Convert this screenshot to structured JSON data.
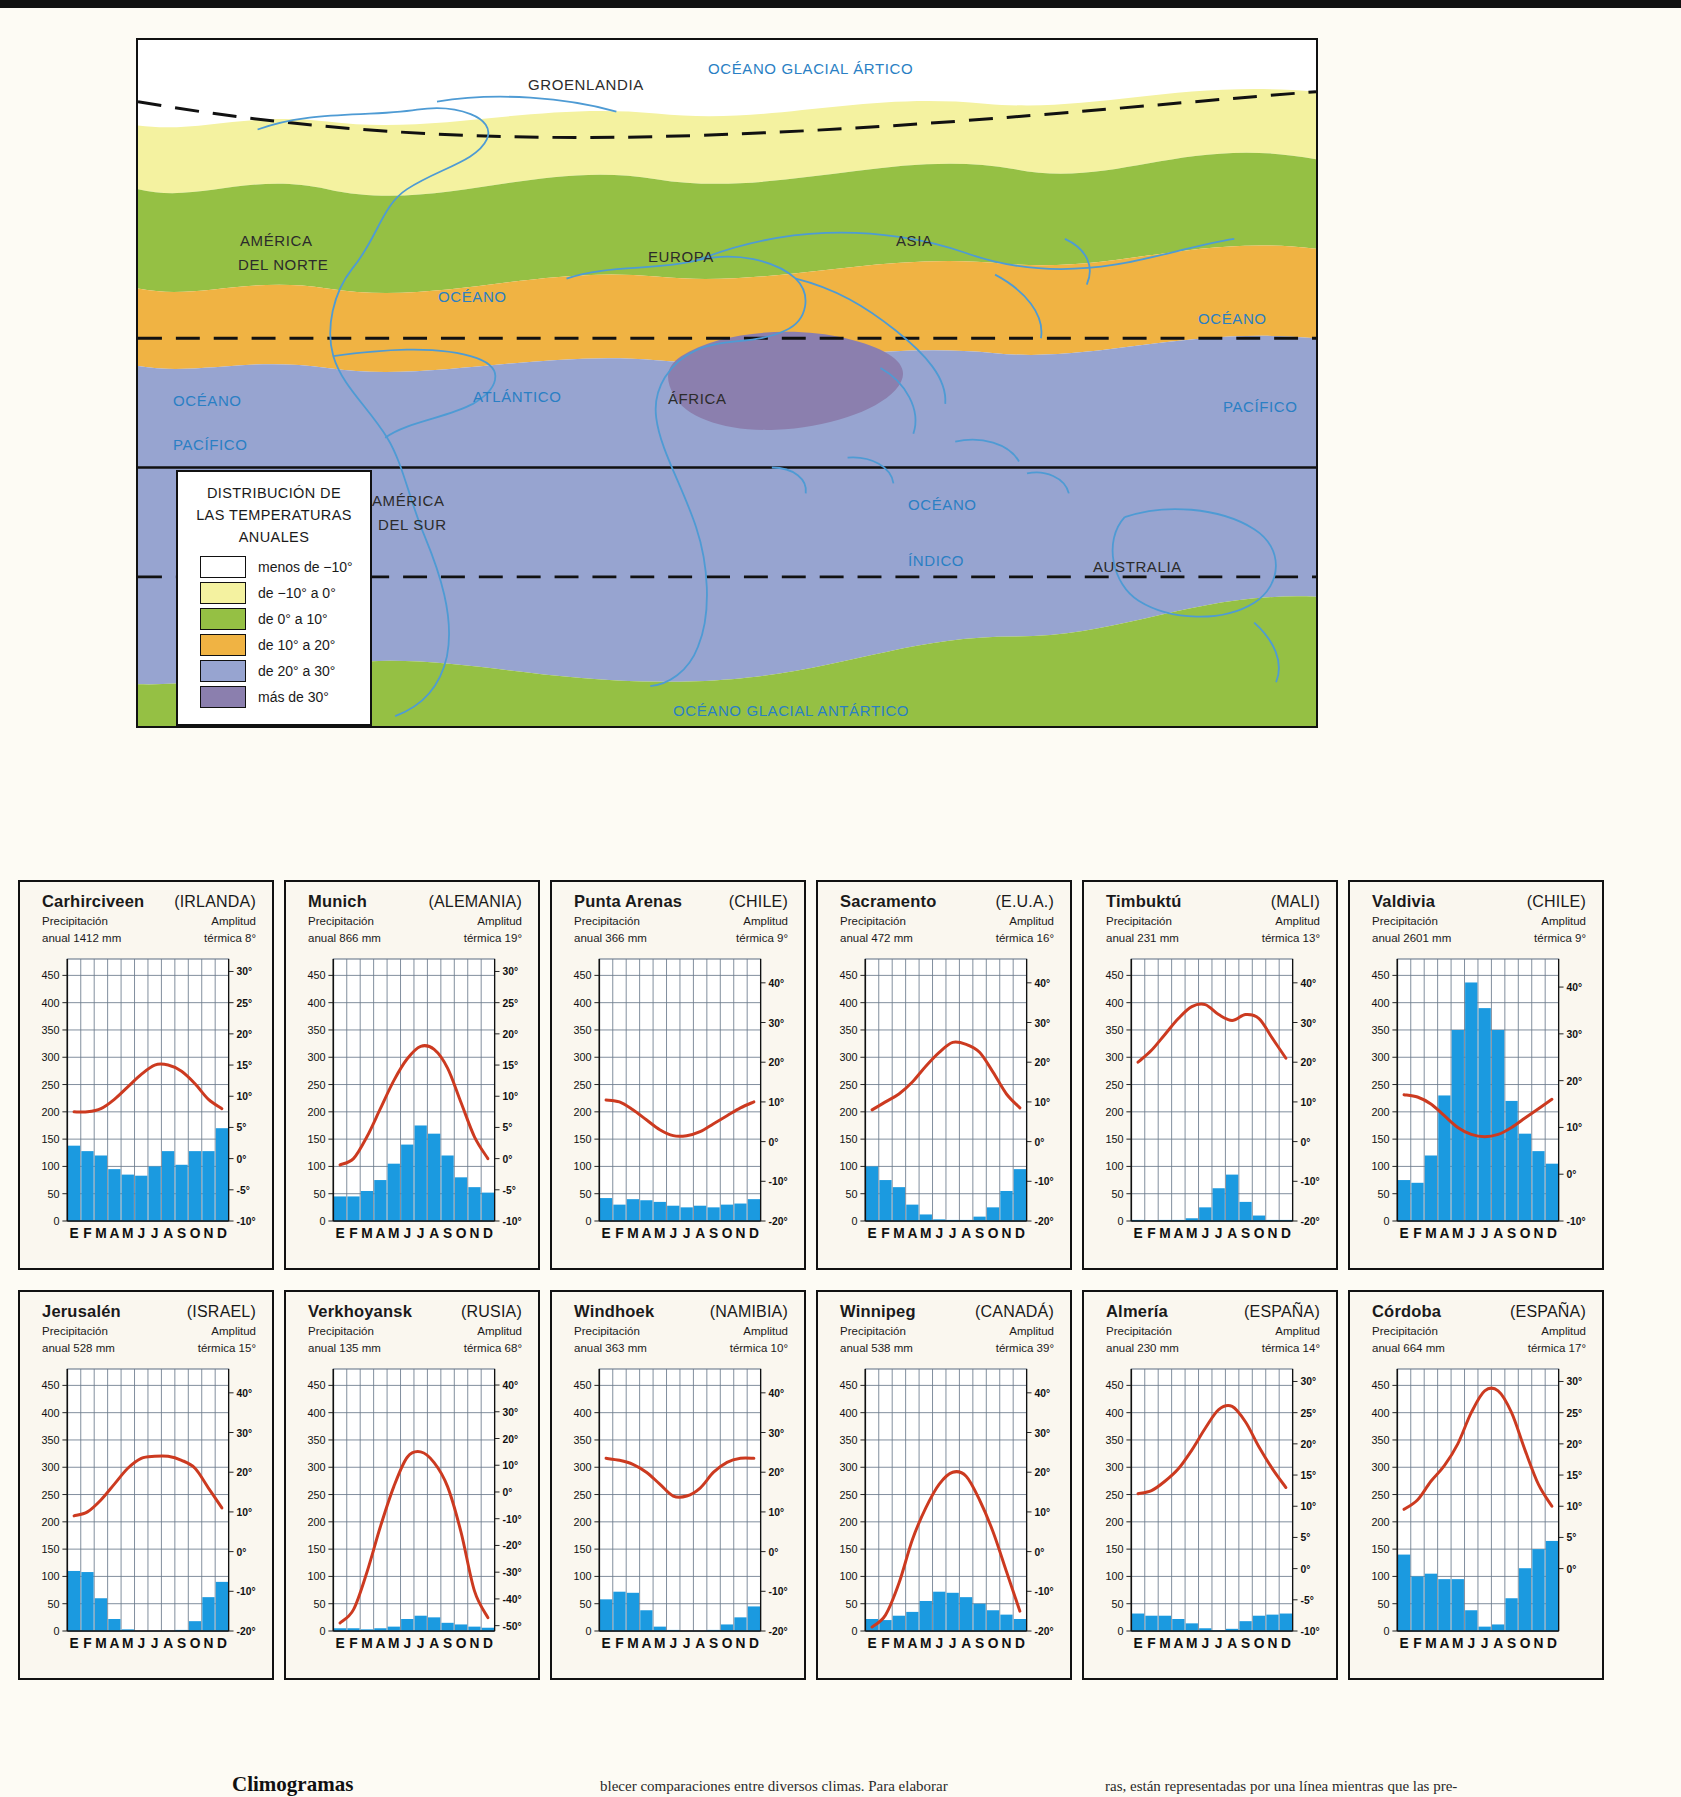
{
  "map": {
    "title_lines": [
      "DISTRIBUCIÓN  DE",
      "LAS TEMPERATURAS",
      "ANUALES"
    ],
    "legend": [
      {
        "label": "menos de −10°",
        "color": "#ffffff"
      },
      {
        "label": "de −10° a 0°",
        "color": "#f4f2a0"
      },
      {
        "label": "de 0° a 10°",
        "color": "#95c044"
      },
      {
        "label": "de 10° a 20°",
        "color": "#f0b343"
      },
      {
        "label": "de 20° a 30°",
        "color": "#97a4d0"
      },
      {
        "label": "más de 30°",
        "color": "#8b7fae"
      }
    ],
    "labels": [
      {
        "text": "OCÉANO GLACIAL ÁRTICO",
        "x": 570,
        "y": 20,
        "ocean": true
      },
      {
        "text": "GROENLANDIA",
        "x": 390,
        "y": 36,
        "ocean": false
      },
      {
        "text": "AMÉRICA",
        "x": 102,
        "y": 192,
        "ocean": false
      },
      {
        "text": "DEL NORTE",
        "x": 100,
        "y": 216,
        "ocean": false
      },
      {
        "text": "EUROPA",
        "x": 510,
        "y": 208,
        "ocean": false
      },
      {
        "text": "ASIA",
        "x": 758,
        "y": 192,
        "ocean": false
      },
      {
        "text": "OCÉANO",
        "x": 300,
        "y": 248,
        "ocean": true
      },
      {
        "text": "OCÉANO",
        "x": 1060,
        "y": 270,
        "ocean": true
      },
      {
        "text": "ATLÁNTICO",
        "x": 335,
        "y": 348,
        "ocean": true
      },
      {
        "text": "ÁFRICA",
        "x": 530,
        "y": 350,
        "ocean": false
      },
      {
        "text": "PACÍFICO",
        "x": 1085,
        "y": 358,
        "ocean": true
      },
      {
        "text": "OCÉANO",
        "x": 35,
        "y": 352,
        "ocean": true
      },
      {
        "text": "PACÍFICO",
        "x": 35,
        "y": 396,
        "ocean": true
      },
      {
        "text": "AMÉRICA",
        "x": 234,
        "y": 452,
        "ocean": false
      },
      {
        "text": "DEL SUR",
        "x": 240,
        "y": 476,
        "ocean": false
      },
      {
        "text": "OCÉANO",
        "x": 770,
        "y": 456,
        "ocean": true
      },
      {
        "text": "ÍNDICO",
        "x": 770,
        "y": 512,
        "ocean": true
      },
      {
        "text": "AUSTRALIA",
        "x": 955,
        "y": 518,
        "ocean": false
      },
      {
        "text": "OCÉANO GLACIAL ANTÁRTICO",
        "x": 535,
        "y": 662,
        "ocean": true
      }
    ]
  },
  "axes": {
    "precip_ticks": [
      0,
      50,
      100,
      150,
      200,
      250,
      300,
      350,
      400,
      450
    ],
    "precip_max": 480,
    "months": [
      "E",
      "F",
      "M",
      "A",
      "M",
      "J",
      "J",
      "A",
      "S",
      "O",
      "N",
      "D"
    ],
    "bar_color": "#1b9ae0",
    "line_color": "#cc3a20",
    "grid_color": "#6a7a8c"
  },
  "chart_data": [
    {
      "type": "bar",
      "title": "Carhirciveen",
      "country": "(IRLANDA)",
      "precip_label_1": "Precipitación",
      "precip_label_2": "anual 1412 mm",
      "amp_label_1": "Amplitud",
      "amp_label_2": "térmica 8°",
      "xlabel": "",
      "ylabel": "mm",
      "categories": [
        "E",
        "F",
        "M",
        "A",
        "M",
        "J",
        "J",
        "A",
        "S",
        "O",
        "N",
        "D"
      ],
      "values": [
        138,
        128,
        120,
        95,
        85,
        83,
        100,
        128,
        103,
        128,
        128,
        170
      ],
      "series": [
        {
          "name": "Temperatura",
          "values": [
            7.5,
            7.5,
            8,
            9.5,
            11.5,
            13.5,
            15,
            15,
            14,
            12,
            9.5,
            8
          ]
        }
      ],
      "temp_ticks": [
        -10,
        -5,
        0,
        5,
        10,
        15,
        20,
        25,
        30
      ],
      "temp_min": -10,
      "temp_max": 32
    },
    {
      "type": "bar",
      "title": "Munich",
      "country": "(ALEMANIA)",
      "precip_label_1": "Precipitación",
      "precip_label_2": "anual 866 mm",
      "amp_label_1": "Amplitud",
      "amp_label_2": "térmica 19°",
      "xlabel": "",
      "ylabel": "mm",
      "categories": [
        "E",
        "F",
        "M",
        "A",
        "M",
        "J",
        "J",
        "A",
        "S",
        "O",
        "N",
        "D"
      ],
      "values": [
        45,
        45,
        55,
        75,
        105,
        140,
        175,
        160,
        120,
        80,
        62,
        52
      ],
      "series": [
        {
          "name": "Temperatura",
          "values": [
            -1,
            0,
            3.5,
            8,
            12.5,
            16,
            18,
            17.5,
            14.5,
            9,
            3.5,
            0
          ]
        }
      ],
      "temp_ticks": [
        -10,
        -5,
        0,
        5,
        10,
        15,
        20,
        25,
        30
      ],
      "temp_min": -10,
      "temp_max": 32
    },
    {
      "type": "bar",
      "title": "Punta  Arenas",
      "country": "(CHILE)",
      "precip_label_1": "Precipitación",
      "precip_label_2": "anual 366 mm",
      "amp_label_1": "Amplitud",
      "amp_label_2": "térmica 9°",
      "xlabel": "",
      "ylabel": "mm",
      "categories": [
        "E",
        "F",
        "M",
        "A",
        "M",
        "J",
        "J",
        "A",
        "S",
        "O",
        "N",
        "D"
      ],
      "values": [
        42,
        30,
        40,
        38,
        35,
        28,
        25,
        28,
        25,
        30,
        32,
        40
      ],
      "series": [
        {
          "name": "Temperatura",
          "values": [
            10.5,
            10,
            8,
            5.5,
            3,
            1.5,
            1.5,
            2.5,
            4.5,
            6.5,
            8.5,
            10
          ]
        }
      ],
      "temp_ticks": [
        -20,
        -10,
        0,
        10,
        20,
        30,
        40
      ],
      "temp_min": -20,
      "temp_max": 46
    },
    {
      "type": "bar",
      "title": "Sacramento",
      "country": "(E.U.A.)",
      "precip_label_1": "Precipitación",
      "precip_label_2": "anual 472 mm",
      "amp_label_1": "Amplitud",
      "amp_label_2": "térmica 16°",
      "xlabel": "",
      "ylabel": "mm",
      "categories": [
        "E",
        "F",
        "M",
        "A",
        "M",
        "J",
        "J",
        "A",
        "S",
        "O",
        "N",
        "D"
      ],
      "values": [
        100,
        75,
        62,
        30,
        12,
        3,
        2,
        2,
        8,
        25,
        55,
        95
      ],
      "series": [
        {
          "name": "Temperatura",
          "values": [
            8,
            10,
            12,
            15,
            19,
            22.5,
            25,
            24.5,
            22.5,
            17.5,
            12,
            8.5
          ]
        }
      ],
      "temp_ticks": [
        -20,
        -10,
        0,
        10,
        20,
        30,
        40
      ],
      "temp_min": -20,
      "temp_max": 46
    },
    {
      "type": "bar",
      "title": "Timbuktú",
      "country": "(MALI)",
      "precip_label_1": "Precipitación",
      "precip_label_2": "anual 231 mm",
      "amp_label_1": "Amplitud",
      "amp_label_2": "térmica 13°",
      "xlabel": "",
      "ylabel": "mm",
      "categories": [
        "E",
        "F",
        "M",
        "A",
        "M",
        "J",
        "J",
        "A",
        "S",
        "O",
        "N",
        "D"
      ],
      "values": [
        2,
        1,
        2,
        2,
        5,
        25,
        60,
        85,
        35,
        10,
        2,
        2
      ],
      "series": [
        {
          "name": "Temperatura",
          "values": [
            20,
            23,
            27,
            31,
            34,
            34.5,
            32,
            30.5,
            32,
            31,
            26,
            21
          ]
        }
      ],
      "temp_ticks": [
        -20,
        -10,
        0,
        10,
        20,
        30,
        40
      ],
      "temp_min": -20,
      "temp_max": 46
    },
    {
      "type": "bar",
      "title": "Valdivia",
      "country": "(CHILE)",
      "precip_label_1": "Precipitación",
      "precip_label_2": "anual 2601 mm",
      "amp_label_1": "Amplitud",
      "amp_label_2": "térmica 9°",
      "xlabel": "",
      "ylabel": "mm",
      "categories": [
        "E",
        "F",
        "M",
        "A",
        "M",
        "J",
        "J",
        "A",
        "S",
        "O",
        "N",
        "D"
      ],
      "values": [
        75,
        70,
        120,
        230,
        350,
        437,
        390,
        350,
        220,
        160,
        128,
        105
      ],
      "series": [
        {
          "name": "Temperatura",
          "values": [
            17,
            16.5,
            15,
            12.5,
            10,
            8.5,
            8,
            8.5,
            10,
            12,
            14,
            16
          ]
        }
      ],
      "temp_ticks": [
        -10,
        0,
        10,
        20,
        30,
        40
      ],
      "temp_min": -10,
      "temp_max": 46
    },
    {
      "type": "bar",
      "title": "Jerusalén",
      "country": "(ISRAEL)",
      "precip_label_1": "Precipitación",
      "precip_label_2": "anual 528 mm",
      "amp_label_1": "Amplitud",
      "amp_label_2": "térmica 15°",
      "xlabel": "",
      "ylabel": "mm",
      "categories": [
        "E",
        "F",
        "M",
        "A",
        "M",
        "J",
        "J",
        "A",
        "S",
        "O",
        "N",
        "D"
      ],
      "values": [
        110,
        108,
        60,
        22,
        3,
        0,
        0,
        0,
        2,
        18,
        62,
        90
      ],
      "series": [
        {
          "name": "Temperatura",
          "values": [
            9,
            10,
            13,
            17,
            21,
            23.5,
            24,
            24,
            23,
            21,
            16,
            11
          ]
        }
      ],
      "temp_ticks": [
        -20,
        -10,
        0,
        10,
        20,
        30,
        40
      ],
      "temp_min": -20,
      "temp_max": 46
    },
    {
      "type": "bar",
      "title": "Verkhoyansk",
      "country": "(RUSIA)",
      "precip_label_1": "Precipitación",
      "precip_label_2": "anual 135 mm",
      "amp_label_1": "Amplitud",
      "amp_label_2": "térmica 68°",
      "xlabel": "",
      "ylabel": "mm",
      "categories": [
        "E",
        "F",
        "M",
        "A",
        "M",
        "J",
        "J",
        "A",
        "S",
        "O",
        "N",
        "D"
      ],
      "values": [
        5,
        5,
        3,
        5,
        8,
        22,
        28,
        25,
        15,
        12,
        8,
        6
      ],
      "series": [
        {
          "name": "Temperatura",
          "values": [
            -49,
            -44,
            -30,
            -13,
            2,
            13,
            15,
            11,
            2,
            -15,
            -37,
            -47
          ]
        }
      ],
      "temp_ticks": [
        -50,
        -40,
        -30,
        -20,
        -10,
        0,
        10,
        20,
        30,
        40
      ],
      "temp_min": -52,
      "temp_max": 46
    },
    {
      "type": "bar",
      "title": "Windhoek",
      "country": "(NAMIBIA)",
      "precip_label_1": "Precipitación",
      "precip_label_2": "anual 363 mm",
      "amp_label_1": "Amplitud",
      "amp_label_2": "térmica 10°",
      "xlabel": "",
      "ylabel": "mm",
      "categories": [
        "E",
        "F",
        "M",
        "A",
        "M",
        "J",
        "J",
        "A",
        "S",
        "O",
        "N",
        "D"
      ],
      "values": [
        58,
        72,
        70,
        38,
        8,
        2,
        0,
        0,
        2,
        12,
        25,
        45
      ],
      "series": [
        {
          "name": "Temperatura",
          "values": [
            23.5,
            23,
            22,
            20,
            17,
            14,
            14,
            16,
            20,
            22.5,
            23.5,
            23.5
          ]
        }
      ],
      "temp_ticks": [
        -20,
        -10,
        0,
        10,
        20,
        30,
        40
      ],
      "temp_min": -20,
      "temp_max": 46
    },
    {
      "type": "bar",
      "title": "Winnipeg",
      "country": "(CANADÁ)",
      "precip_label_1": "Precipitación",
      "precip_label_2": "anual 538 mm",
      "amp_label_1": "Amplitud",
      "amp_label_2": "térmica 39°",
      "xlabel": "",
      "ylabel": "mm",
      "categories": [
        "E",
        "F",
        "M",
        "A",
        "M",
        "J",
        "J",
        "A",
        "S",
        "O",
        "N",
        "D"
      ],
      "values": [
        22,
        20,
        28,
        35,
        55,
        72,
        70,
        62,
        50,
        38,
        30,
        22
      ],
      "series": [
        {
          "name": "Temperatura",
          "values": [
            -19,
            -16,
            -8,
            3,
            11,
            17,
            20,
            19,
            13,
            5,
            -5,
            -15
          ]
        }
      ],
      "temp_ticks": [
        -20,
        -10,
        0,
        10,
        20,
        30,
        40
      ],
      "temp_min": -20,
      "temp_max": 46
    },
    {
      "type": "bar",
      "title": "Almería",
      "country": "(ESPAÑA)",
      "precip_label_1": "Precipitación",
      "precip_label_2": "anual 230 mm",
      "amp_label_1": "Amplitud",
      "amp_label_2": "térmica 14°",
      "xlabel": "",
      "ylabel": "mm",
      "categories": [
        "E",
        "F",
        "M",
        "A",
        "M",
        "J",
        "J",
        "A",
        "S",
        "O",
        "N",
        "D"
      ],
      "values": [
        32,
        28,
        28,
        22,
        14,
        5,
        1,
        4,
        18,
        28,
        30,
        32
      ],
      "series": [
        {
          "name": "Temperatura",
          "values": [
            12,
            12.5,
            14,
            16,
            19,
            22.5,
            25.5,
            26,
            23.5,
            19.5,
            16,
            13
          ]
        }
      ],
      "temp_ticks": [
        -10,
        -5,
        0,
        5,
        10,
        15,
        20,
        25,
        30
      ],
      "temp_min": -10,
      "temp_max": 32
    },
    {
      "type": "bar",
      "title": "Córdoba",
      "country": "(ESPAÑA)",
      "precip_label_1": "Precipitación",
      "precip_label_2": "anual 664 mm",
      "amp_label_1": "Amplitud",
      "amp_label_2": "térmica 17°",
      "xlabel": "",
      "ylabel": "mm",
      "categories": [
        "E",
        "F",
        "M",
        "A",
        "M",
        "J",
        "J",
        "A",
        "S",
        "O",
        "N",
        "D"
      ],
      "values": [
        140,
        100,
        105,
        95,
        95,
        38,
        8,
        12,
        60,
        115,
        150,
        165
      ],
      "series": [
        {
          "name": "Temperatura",
          "values": [
            9.5,
            11,
            14,
            16.5,
            20,
            25,
            28.5,
            28.5,
            25,
            19,
            13.5,
            10
          ]
        }
      ],
      "temp_ticks": [
        0,
        5,
        10,
        15,
        20,
        25,
        30
      ],
      "temp_min": -10,
      "temp_max": 32
    }
  ],
  "footer": {
    "title": "Climogramas",
    "col2": "blecer comparaciones entre diversos climas. Para elaborar",
    "col3": "ras, están representadas por una línea mientras que las pre-"
  }
}
